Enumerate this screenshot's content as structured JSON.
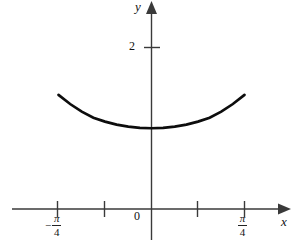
{
  "figure": {
    "background_color": "#ffffff",
    "ink_color": "#111111",
    "axis_color": "#444444",
    "curve_color": "#000000"
  },
  "axes": {
    "x_axis_label": "x",
    "y_axis_label": "y",
    "origin_label": "0",
    "y_tick_labels": [
      "2"
    ],
    "x_tick_labels": [
      {
        "sign": "−",
        "numerator": "π",
        "denominator": "4"
      },
      {
        "sign": "",
        "numerator": "π",
        "denominator": "4"
      }
    ],
    "x_arrowhead": "arrow-right-icon",
    "y_arrowhead": "arrow-up-icon"
  },
  "chart_data": {
    "type": "line",
    "title": "",
    "xlabel": "x",
    "ylabel": "y",
    "function": "y = sec(x)",
    "xlim": [
      -1.0472,
      1.0472
    ],
    "ylim": [
      -0.45,
      2.55
    ],
    "xticks": [
      -0.7854,
      -0.3927,
      0,
      0.3927,
      0.7854
    ],
    "xticklabels": [
      "-π/4",
      "",
      "0",
      "",
      "π/4"
    ],
    "yticks": [
      2
    ],
    "yticklabels": [
      "2"
    ],
    "grid": false,
    "legend": false,
    "series": [
      {
        "name": "sec(x)",
        "x": [
          -0.7854,
          -0.6872,
          -0.589,
          -0.4909,
          -0.3927,
          -0.2945,
          -0.1963,
          -0.0982,
          0,
          0.0982,
          0.1963,
          0.2945,
          0.3927,
          0.4909,
          0.589,
          0.6872,
          0.7854
        ],
        "y": [
          1.414,
          1.3,
          1.205,
          1.13,
          1.082,
          1.045,
          1.02,
          1.005,
          1.0,
          1.005,
          1.02,
          1.045,
          1.082,
          1.13,
          1.205,
          1.3,
          1.414
        ]
      }
    ]
  }
}
